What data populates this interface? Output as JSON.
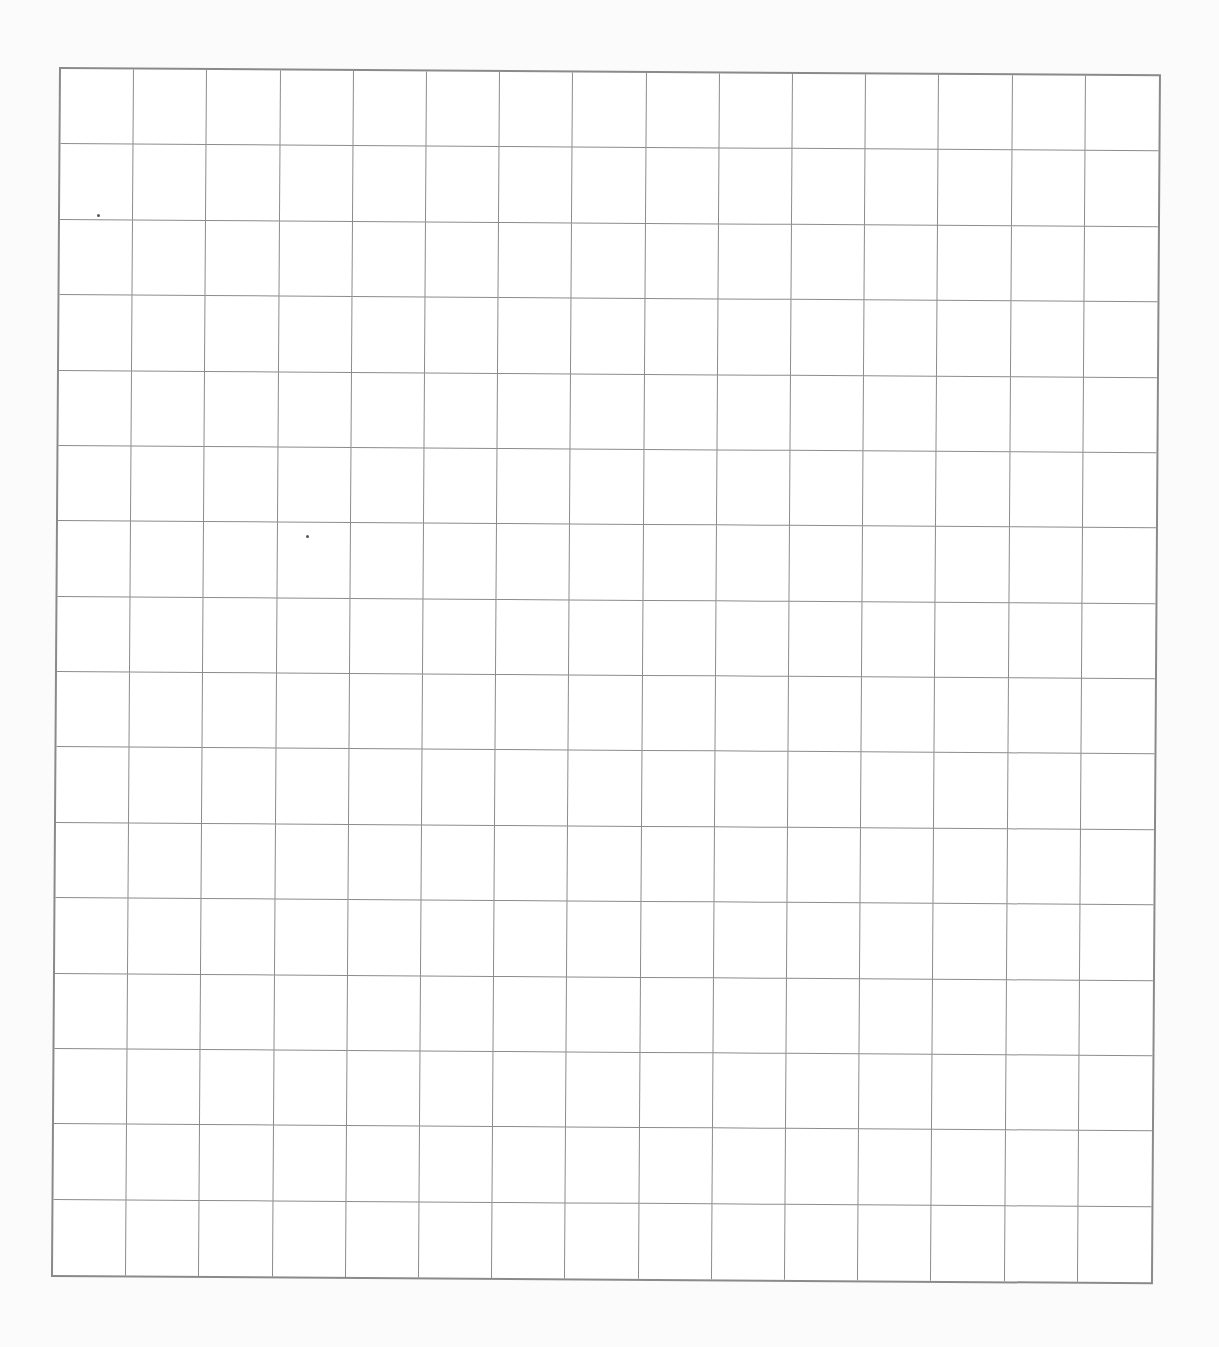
{
  "sheet": {
    "type": "blank-grid",
    "columns": 15,
    "rows": 16,
    "line_color": "#8c8c8c",
    "border_color": "#8a8a8a",
    "background": "#ffffff"
  }
}
